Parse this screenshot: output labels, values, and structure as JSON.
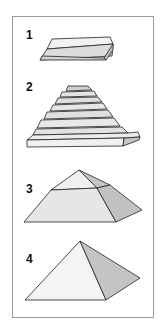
{
  "figure": {
    "steps": [
      {
        "label": "1",
        "stage": "base-slab"
      },
      {
        "label": "2",
        "stage": "stepped-layers"
      },
      {
        "label": "3",
        "stage": "truncated-pyramid"
      },
      {
        "label": "4",
        "stage": "complete-pyramid"
      }
    ],
    "colors": {
      "border": "#9a9a9a",
      "outline": "#222222",
      "face_light": "#f2f2f2",
      "face_mid": "#dcdcdc",
      "face_dark": "#bdbdbd"
    }
  }
}
